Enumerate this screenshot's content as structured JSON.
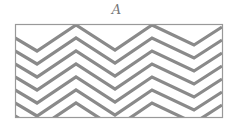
{
  "figure": {
    "label": "A",
    "box": {
      "x": 15.5,
      "y": 24.5,
      "w": 207,
      "h": 93
    },
    "stroke_color": "#8a8a8a",
    "box_color": "#999999",
    "line_count": 7,
    "zigzag_x": [
      15,
      37,
      76,
      115,
      152,
      194,
      222
    ],
    "first_line_y": [
      38,
      51,
      25,
      50,
      25,
      45,
      27
    ],
    "line_spacing": 13
  }
}
